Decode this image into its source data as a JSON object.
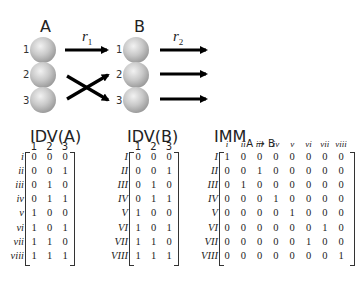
{
  "network": {
    "layer_a": {
      "label": "A",
      "nodes": [
        "1",
        "2",
        "3"
      ]
    },
    "layer_b": {
      "label": "B",
      "nodes": [
        "1",
        "2",
        "3"
      ]
    },
    "rate_1": "r",
    "rate_1_sub": "1",
    "rate_2": "r",
    "rate_2_sub": "2",
    "connections_a_to_b": [
      {
        "from": "1",
        "to": "1"
      },
      {
        "from": "2",
        "to": "3"
      },
      {
        "from": "3",
        "to": "2"
      }
    ],
    "outputs_b": [
      "1",
      "2",
      "3"
    ]
  },
  "idv_a": {
    "title": "IDV(A)",
    "col_headers": [
      "1",
      "2",
      "3"
    ],
    "row_labels": [
      "i",
      "ii",
      "iii",
      "iv",
      "v",
      "vi",
      "vii",
      "viii"
    ],
    "rows": [
      [
        "0",
        "0",
        "0"
      ],
      [
        "0",
        "0",
        "1"
      ],
      [
        "0",
        "1",
        "0"
      ],
      [
        "0",
        "1",
        "1"
      ],
      [
        "1",
        "0",
        "0"
      ],
      [
        "1",
        "0",
        "1"
      ],
      [
        "1",
        "1",
        "0"
      ],
      [
        "1",
        "1",
        "1"
      ]
    ]
  },
  "idv_b": {
    "title": "IDV(B)",
    "col_headers": [
      "1",
      "2",
      "3"
    ],
    "row_labels": [
      "I",
      "II",
      "III",
      "IV",
      "V",
      "VI",
      "VII",
      "VIII"
    ],
    "rows": [
      [
        "0",
        "0",
        "0"
      ],
      [
        "0",
        "0",
        "1"
      ],
      [
        "0",
        "1",
        "0"
      ],
      [
        "0",
        "1",
        "1"
      ],
      [
        "1",
        "0",
        "0"
      ],
      [
        "1",
        "0",
        "1"
      ],
      [
        "1",
        "1",
        "0"
      ],
      [
        "1",
        "1",
        "1"
      ]
    ]
  },
  "imm": {
    "title": "IMM",
    "title_sub": "A → B",
    "col_headers": [
      "i",
      "ii",
      "iii",
      "iv",
      "v",
      "vi",
      "vii",
      "viii"
    ],
    "row_labels": [
      "I",
      "II",
      "III",
      "IV",
      "V",
      "VI",
      "VII",
      "VIII"
    ],
    "rows": [
      [
        "1",
        "0",
        "0",
        "0",
        "0",
        "0",
        "0",
        "0"
      ],
      [
        "0",
        "0",
        "1",
        "0",
        "0",
        "0",
        "0",
        "0"
      ],
      [
        "0",
        "1",
        "0",
        "0",
        "0",
        "0",
        "0",
        "0"
      ],
      [
        "0",
        "0",
        "0",
        "1",
        "0",
        "0",
        "0",
        "0"
      ],
      [
        "0",
        "0",
        "0",
        "0",
        "1",
        "0",
        "0",
        "0"
      ],
      [
        "0",
        "0",
        "0",
        "0",
        "0",
        "0",
        "1",
        "0"
      ],
      [
        "0",
        "0",
        "0",
        "0",
        "0",
        "1",
        "0",
        "0"
      ],
      [
        "0",
        "0",
        "0",
        "0",
        "0",
        "0",
        "0",
        "1"
      ]
    ]
  },
  "colors": {
    "sphere_fill": "#c8c8c8",
    "sphere_highlight": "#ececec",
    "sphere_shadow": "#9a9a9a",
    "arrow": "#000000",
    "text": "#222222"
  }
}
